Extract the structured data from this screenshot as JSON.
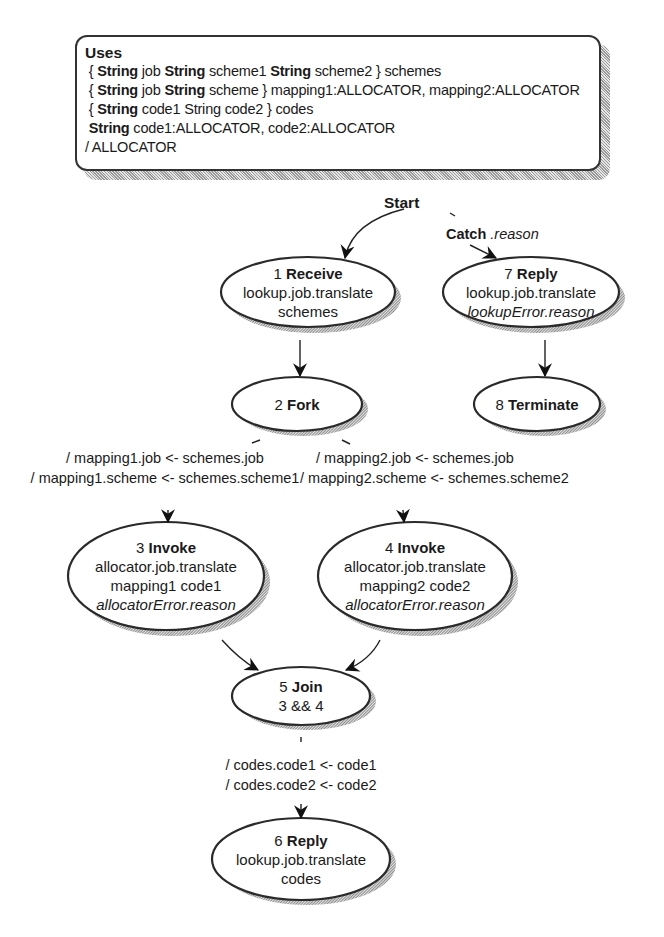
{
  "uses": {
    "title": "Uses",
    "lines": [
      {
        "kw1": "String",
        "t1": " job ",
        "kw2": "String",
        "t2": " scheme1 ",
        "kw3": "String",
        "t3": " scheme2 } schemes",
        "prefix": "{ "
      },
      {
        "kw1": "String",
        "t1": " job ",
        "kw2": "String",
        "t2": " scheme } mapping1:ALLOCATOR, mapping2:ALLOCATOR",
        "prefix": "{ "
      },
      {
        "kw1": "String",
        "t1": " code1 String code2 } codes",
        "prefix": "{ "
      },
      {
        "kw1": "String",
        "t1": " code1:ALLOCATOR, code2:ALLOCATOR",
        "prefix": ""
      },
      {
        "t1": "/ ALLOCATOR"
      }
    ]
  },
  "start": {
    "label": "Start"
  },
  "catch": {
    "label": "Catch",
    "arg": ".reason"
  },
  "nodes": [
    {
      "id": "1",
      "num": "1",
      "kind": "Receive",
      "lines": [
        "lookup.job.translate",
        "schemes"
      ],
      "italic_line": ""
    },
    {
      "id": "2",
      "num": "2",
      "kind": "Fork",
      "lines": [],
      "italic_line": ""
    },
    {
      "id": "3",
      "num": "3",
      "kind": "Invoke",
      "lines": [
        "allocator.job.translate",
        "mapping1 code1"
      ],
      "italic_line": "allocatorError.reason"
    },
    {
      "id": "4",
      "num": "4",
      "kind": "Invoke",
      "lines": [
        "allocator.job.translate",
        "mapping2 code2"
      ],
      "italic_line": "allocatorError.reason"
    },
    {
      "id": "5",
      "num": "5",
      "kind": "Join",
      "lines": [
        "3 && 4"
      ],
      "italic_line": ""
    },
    {
      "id": "6",
      "num": "6",
      "kind": "Reply",
      "lines": [
        "lookup.job.translate",
        "codes"
      ],
      "italic_line": ""
    },
    {
      "id": "7",
      "num": "7",
      "kind": "Reply",
      "lines": [
        "lookup.job.translate"
      ],
      "italic_line": "lookupError.reason"
    },
    {
      "id": "8",
      "num": "8",
      "kind": "Terminate",
      "lines": [],
      "italic_line": ""
    }
  ],
  "edges": {
    "fork_to_3": [
      "/ mapping1.job <- schemes.job",
      "/ mapping1.scheme <- schemes.scheme1"
    ],
    "fork_to_4": [
      "/ mapping2.job <- schemes.job",
      "/ mapping2.scheme <- schemes.scheme2"
    ],
    "join_to_6": [
      "/ codes.code1 <- code1",
      "/ codes.code2 <- code2"
    ]
  }
}
